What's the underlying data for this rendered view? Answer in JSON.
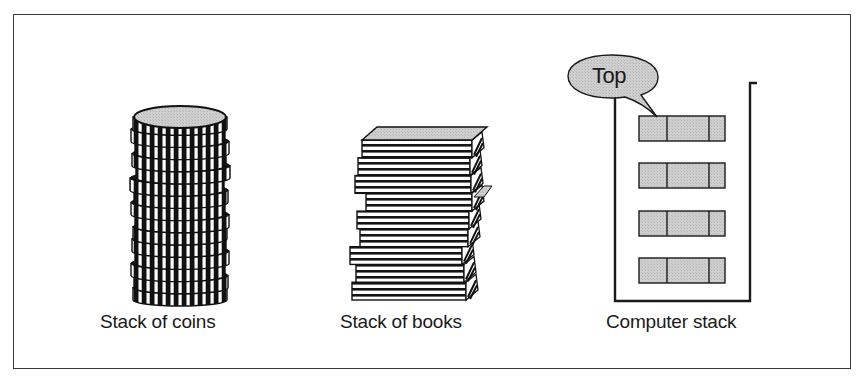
{
  "diagram": {
    "title": "",
    "colors": {
      "ink": "#1a1a1a",
      "fill_gray": "#c8c8c8",
      "paper": "#ffffff",
      "frame": "#3a3a3a"
    },
    "panels": [
      {
        "id": "coins",
        "label": "Stack of coins",
        "coin_count": 15
      },
      {
        "id": "books",
        "label": "Stack of books",
        "book_count": 9
      },
      {
        "id": "computer",
        "label": "Computer stack",
        "pointer_label": "Top",
        "element_count": 4,
        "element_cells": 3
      }
    ]
  }
}
